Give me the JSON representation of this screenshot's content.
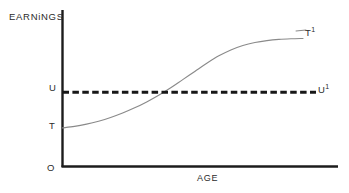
{
  "figure": {
    "background_color": "#ffffff",
    "axis_color": "#1c1c1c",
    "curve_color": "#8a8a8a",
    "dashed_color": "#171717"
  },
  "axes": {
    "y_title": "EARNiNGS",
    "x_title": "AGE",
    "origin_label": "O"
  },
  "labels": {
    "u": "U",
    "t": "T",
    "t_prime_base": "T",
    "t_prime_sup": "1",
    "u_prime_base": "U",
    "u_prime_sup": "1"
  },
  "chart_data": {
    "type": "line",
    "title": "",
    "xlabel": "AGE",
    "ylabel": "EARNiNGS",
    "grid": false,
    "legend": "none",
    "xlim": [
      0,
      100
    ],
    "ylim": [
      0,
      100
    ],
    "axis_ticks": {
      "x": [],
      "y": [
        "T",
        "U"
      ]
    },
    "annotations": [
      {
        "text": "O",
        "x": 0,
        "y": 0,
        "role": "origin"
      },
      {
        "text": "T",
        "x": 0,
        "y": 26,
        "role": "curve-start-tick"
      },
      {
        "text": "U",
        "x": 0,
        "y": 50,
        "role": "reference-level-tick"
      },
      {
        "text": "T1",
        "x": 100,
        "y": 86,
        "role": "curve-end"
      },
      {
        "text": "U1",
        "x": 100,
        "y": 50,
        "role": "reference-line-end"
      }
    ],
    "series": [
      {
        "name": "T to T1",
        "style": "solid",
        "color": "#8a8a8a",
        "description": "S-shaped (sigmoid) earnings-age profile rising from T, crossing U near mid-career, flattening toward T1",
        "x": [
          0,
          5,
          10,
          15,
          20,
          25,
          30,
          35,
          40,
          45,
          50,
          55,
          60,
          65,
          70,
          75,
          80,
          85,
          90,
          95,
          100
        ],
        "y": [
          26,
          27,
          28.5,
          30.5,
          33,
          36,
          39.5,
          43.5,
          48,
          53,
          58.5,
          64,
          69.5,
          74.5,
          78.5,
          81.5,
          83.5,
          84.8,
          85.6,
          86,
          86.2
        ]
      },
      {
        "name": "U to U1",
        "style": "dashed",
        "color": "#171717",
        "description": "Constant horizontal reference level at U",
        "x": [
          0,
          100
        ],
        "y": [
          50,
          50
        ]
      }
    ],
    "crossing_point": {
      "x": 52,
      "y": 50,
      "description": "earnings profile crosses the U reference level"
    }
  }
}
